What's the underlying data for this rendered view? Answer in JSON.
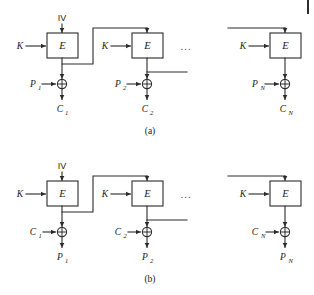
{
  "figure": {
    "ink_color": "#2b2b2b",
    "background_color": "#ffffff"
  },
  "panels": [
    {
      "id": "panel-a",
      "caption": "(a)",
      "direction": "encryption",
      "iv_label": "IV",
      "ellipsis": "...",
      "stages": [
        {
          "index": 1,
          "key_label": "K",
          "cipher_label": "E",
          "xor_glyph": "⊕",
          "input_label": "P",
          "input_subscript": "1",
          "output_label": "C",
          "output_subscript": "1"
        },
        {
          "index": 2,
          "key_label": "K",
          "cipher_label": "E",
          "xor_glyph": "⊕",
          "input_label": "P",
          "input_subscript": "2",
          "output_label": "C",
          "output_subscript": "2"
        },
        {
          "index": 3,
          "key_label": "K",
          "cipher_label": "E",
          "xor_glyph": "⊕",
          "input_label": "P",
          "input_subscript": "N",
          "output_label": "C",
          "output_subscript": "N"
        }
      ]
    },
    {
      "id": "panel-b",
      "caption": "(b)",
      "direction": "decryption",
      "iv_label": "IV",
      "ellipsis": "...",
      "stages": [
        {
          "index": 1,
          "key_label": "K",
          "cipher_label": "E",
          "xor_glyph": "⊕",
          "input_label": "C",
          "input_subscript": "1",
          "output_label": "P",
          "output_subscript": "1"
        },
        {
          "index": 2,
          "key_label": "K",
          "cipher_label": "E",
          "xor_glyph": "⊕",
          "input_label": "C",
          "input_subscript": "2",
          "output_label": "P",
          "output_subscript": "2"
        },
        {
          "index": 3,
          "key_label": "K",
          "cipher_label": "E",
          "xor_glyph": "⊕",
          "input_label": "C",
          "input_subscript": "N",
          "output_label": "P",
          "output_subscript": "N"
        }
      ]
    }
  ]
}
